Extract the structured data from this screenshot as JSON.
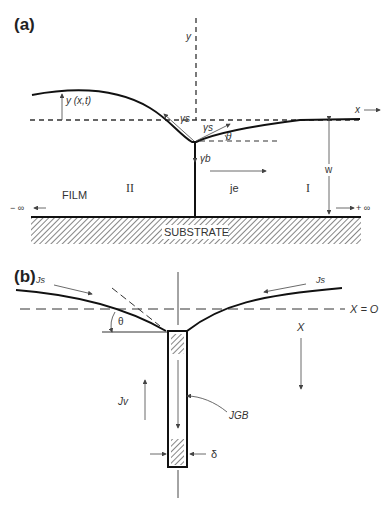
{
  "panel_a": {
    "label": "(a)",
    "axis_y": "y",
    "axis_x": "x",
    "profile": "y (x,t)",
    "gamma_s_left": "γs",
    "gamma_s_right": "γs",
    "gamma_b": "γb",
    "theta": "θ",
    "flux": "je",
    "region_left": "II",
    "region_right": "I",
    "film": "FILM",
    "width": "w",
    "minus_inf": "− ∞",
    "plus_inf": "+ ∞",
    "substrate": "SUBSTRATE"
  },
  "panel_b": {
    "label": "(b)",
    "js_left": "Js",
    "js_right": "Js",
    "origin": "X = O",
    "theta": "θ",
    "x_axis": "X",
    "jv": "Jv",
    "jgb": "JGB",
    "delta": "δ"
  }
}
